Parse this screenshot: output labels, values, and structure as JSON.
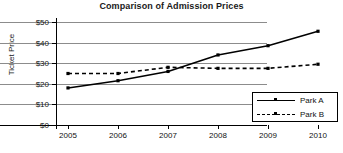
{
  "chart_data": {
    "type": "line",
    "title": "Comparison of Admission Prices",
    "xlabel": "",
    "ylabel": "Ticket Price",
    "categories": [
      "2005",
      "2006",
      "2007",
      "2008",
      "2009",
      "2010"
    ],
    "x": [
      2005,
      2006,
      2007,
      2008,
      2009,
      2010
    ],
    "series": [
      {
        "name": "Park A",
        "values": [
          18,
          21.5,
          26,
          34,
          38.5,
          45.5
        ],
        "linestyle": "solid",
        "marker": "square",
        "color": "#000000"
      },
      {
        "name": "Park B",
        "values": [
          25,
          25,
          28,
          27.5,
          27.5,
          29.5
        ],
        "linestyle": "dashed",
        "marker": "square",
        "color": "#000000"
      }
    ],
    "ylim": [
      0,
      50
    ],
    "ytick_values": [
      0,
      10,
      20,
      30,
      40,
      50
    ],
    "ytick_labels": [
      "$0",
      "$10",
      "$20",
      "$30",
      "$40",
      "$50"
    ],
    "xtick_labels": [
      "2005",
      "2006",
      "2007",
      "2008",
      "2009",
      "2010"
    ],
    "grid": "horizontal",
    "legend_position": "bottom-right",
    "legend_entries": [
      "Park A",
      "Park B"
    ]
  },
  "legend": {
    "park_a_label": "Park A",
    "park_b_label": "Park B"
  },
  "axes": {
    "y_title": "Ticket Price",
    "y_labels": [
      "$50",
      "$40",
      "$30",
      "$20",
      "$10",
      "$0"
    ],
    "x_labels": [
      "2005",
      "2006",
      "2007",
      "2008",
      "2009",
      "2010"
    ]
  },
  "header": {
    "title": "Comparison of Admission Prices"
  }
}
